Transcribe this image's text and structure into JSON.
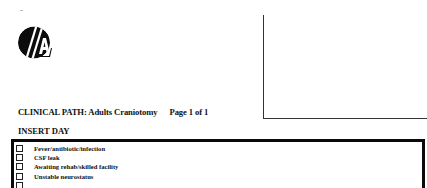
{
  "header": {
    "logo_icon": "circle-slash-a-logo-icon"
  },
  "document": {
    "title": "CLINICAL PATH:  Adults Craniotomy",
    "page_indicator": "Page 1 of 1",
    "section_heading": "INSERT DAY"
  },
  "checklist": {
    "items": [
      {
        "label": "Fever/antibiotic/infection",
        "checked": false
      },
      {
        "label": "CSF leak",
        "checked": false
      },
      {
        "label": "Awaiting rehab/skilled facility",
        "checked": false
      },
      {
        "label": "Unstable neurostatus",
        "checked": false
      },
      {
        "label": "",
        "checked": false
      }
    ]
  },
  "colors": {
    "text": "#111111",
    "border": "#0a0a0a",
    "background": "#ffffff"
  }
}
